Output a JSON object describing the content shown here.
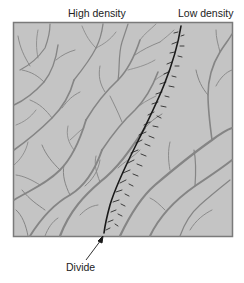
{
  "diagram": {
    "labels": {
      "high_density": "High density",
      "low_density": "Low density",
      "divide": "Divide"
    },
    "panel": {
      "fill": "#c4c4c4",
      "border": "#7a7a7a",
      "stream_color": "#858585",
      "divide_color": "#1a1a1a"
    }
  }
}
